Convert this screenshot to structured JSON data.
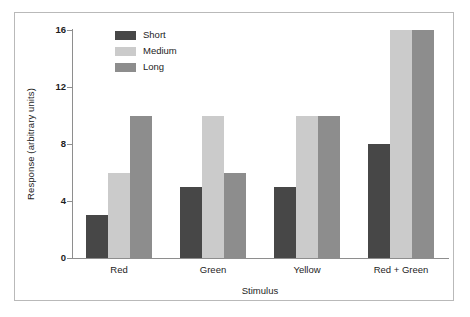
{
  "chart_data": {
    "type": "bar",
    "title": "",
    "xlabel": "Stimulus",
    "ylabel": "Response (arbitrary units)",
    "categories": [
      "Red",
      "Green",
      "Yellow",
      "Red + Green"
    ],
    "series": [
      {
        "name": "Short",
        "color": "#474747",
        "values": [
          3,
          5,
          5,
          8
        ]
      },
      {
        "name": "Medium",
        "color": "#cbcbcb",
        "values": [
          6,
          10,
          10,
          16
        ]
      },
      {
        "name": "Long",
        "color": "#8d8d8d",
        "values": [
          10,
          6,
          10,
          16
        ]
      }
    ],
    "ylim": [
      0,
      16
    ],
    "yticks": [
      0,
      4,
      8,
      12,
      16
    ],
    "ytick_labels": [
      "0",
      "4",
      "8",
      "12",
      "16"
    ],
    "grid": false,
    "legend_position": "top-left-inside",
    "axis_color": "#8e8e8e",
    "background_color": "#ffffff",
    "frame_color": "#b9b9b9"
  },
  "legend": {
    "items": [
      {
        "label": "Short"
      },
      {
        "label": "Medium"
      },
      {
        "label": "Long"
      }
    ]
  },
  "axes": {
    "y_title": "Response (arbitrary units)",
    "x_title": "Stimulus",
    "y_labels": [
      "16",
      "12",
      "8",
      "4",
      "0"
    ],
    "x_labels": [
      "Red",
      "Green",
      "Yellow",
      "Red + Green"
    ]
  }
}
